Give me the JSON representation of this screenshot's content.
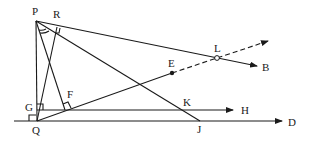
{
  "diagram": {
    "type": "geometry",
    "points": {
      "P": {
        "label": "P",
        "x": 36,
        "y": 21
      },
      "R": {
        "label": "R",
        "x": 57,
        "y": 27
      },
      "Q": {
        "label": "Q",
        "x": 37,
        "y": 121
      },
      "G": {
        "label": "G",
        "x": 37,
        "y": 110
      },
      "F": {
        "label": "F",
        "x": 65,
        "y": 110
      },
      "E": {
        "label": "E",
        "x": 172,
        "y": 73
      },
      "L": {
        "label": "L",
        "x": 217,
        "y": 58
      },
      "K": {
        "label": "K",
        "x": 183,
        "y": 110
      },
      "J": {
        "label": "J",
        "x": 200,
        "y": 121
      },
      "B": {
        "label": "B"
      },
      "H": {
        "label": "H"
      },
      "D": {
        "label": "D"
      }
    },
    "segments": [
      "PQ",
      "PB (ray through R, L)",
      "PJ",
      "PF",
      "QR",
      "QE",
      "GH (ray through F, K)",
      "line through Q to D (through J)",
      "E to L dashed ray"
    ],
    "right_angle_marks": [
      "R",
      "G",
      "F",
      "Q"
    ],
    "angle_arcs": [
      "at P"
    ]
  }
}
